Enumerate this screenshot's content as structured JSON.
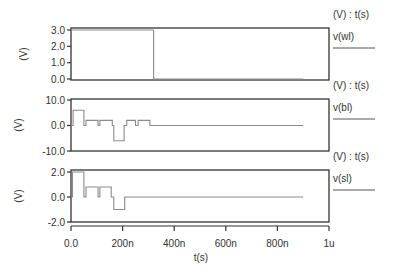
{
  "chart_data": {
    "type": "line",
    "title": "",
    "xlabel": "t(s)",
    "x_unit_scale": "seconds (n = 1e-9, u = 1e-6)",
    "xlim": [
      0,
      1e-06
    ],
    "x_ticks": [
      {
        "value": 0,
        "label": "0.0"
      },
      {
        "value": 2e-07,
        "label": "200n"
      },
      {
        "value": 4e-07,
        "label": "400n"
      },
      {
        "value": 6e-07,
        "label": "600n"
      },
      {
        "value": 8e-07,
        "label": "800n"
      },
      {
        "value": 1e-06,
        "label": "1u"
      }
    ],
    "panels": [
      {
        "name": "v(wl)",
        "ylabel": "(V)",
        "legend_header": "(V) : t(s)",
        "legend_label": "v(wl)",
        "ylim": [
          0,
          3.0
        ],
        "y_ticks": [
          {
            "value": 0,
            "label": "0.0"
          },
          {
            "value": 1.0,
            "label": "1.0"
          },
          {
            "value": 2.0,
            "label": "2.0"
          },
          {
            "value": 3.0,
            "label": "3.0"
          }
        ],
        "series": {
          "name": "v(wl)",
          "x": [
            0,
            3.2e-07,
            3.2e-07,
            9e-07
          ],
          "y": [
            3.0,
            3.0,
            0,
            0
          ]
        }
      },
      {
        "name": "v(bl)",
        "ylabel": "(V)",
        "legend_header": "(V) : t(s)",
        "legend_label": "v(bl)",
        "ylim": [
          -10.0,
          10.0
        ],
        "y_ticks": [
          {
            "value": -10.0,
            "label": "-10.0"
          },
          {
            "value": 0,
            "label": "0.0"
          },
          {
            "value": 10.0,
            "label": "10.0"
          }
        ],
        "series": {
          "name": "v(bl)",
          "x": [
            0,
            8e-09,
            8e-09,
            5e-08,
            5e-08,
            5.8e-08,
            5.8e-08,
            1.05e-07,
            1.05e-07,
            1.12e-07,
            1.12e-07,
            1.6e-07,
            1.6e-07,
            1.66e-07,
            1.66e-07,
            2.06e-07,
            2.06e-07,
            2.16e-07,
            2.16e-07,
            2.5e-07,
            2.5e-07,
            2.6e-07,
            2.6e-07,
            3.06e-07,
            3.06e-07,
            9e-07
          ],
          "y": [
            0,
            0,
            6,
            6,
            0,
            0,
            2,
            2,
            0,
            0,
            2,
            2,
            0,
            0,
            -6,
            -6,
            0,
            0,
            2,
            2,
            0,
            0,
            2,
            2,
            0,
            0
          ]
        }
      },
      {
        "name": "v(sl)",
        "ylabel": "(V)",
        "legend_header": "(V) : t(s)",
        "legend_label": "v(sl)",
        "ylim": [
          -2.0,
          2.0
        ],
        "y_ticks": [
          {
            "value": -2.0,
            "label": "-2.0"
          },
          {
            "value": 0,
            "label": "0.0"
          },
          {
            "value": 2.0,
            "label": "2.0"
          }
        ],
        "series": {
          "name": "v(sl)",
          "x": [
            0,
            6e-09,
            6e-09,
            5e-08,
            5e-08,
            5.8e-08,
            5.8e-08,
            1.05e-07,
            1.05e-07,
            1.12e-07,
            1.12e-07,
            1.56e-07,
            1.56e-07,
            1.66e-07,
            1.66e-07,
            2.08e-07,
            2.08e-07,
            9e-07
          ],
          "y": [
            0,
            0,
            2.0,
            2.0,
            0,
            0,
            0.8,
            0.8,
            0,
            0,
            0.8,
            0.8,
            0,
            0,
            -1.0,
            -1.0,
            0,
            0
          ]
        }
      }
    ],
    "grid": false,
    "legend_position": "right"
  }
}
